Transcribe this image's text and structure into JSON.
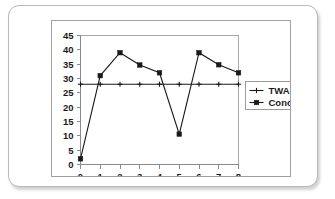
{
  "chart_data": {
    "type": "line",
    "title": "",
    "xlabel": "",
    "ylabel": "",
    "x": [
      0,
      1,
      2,
      3,
      4,
      5,
      6,
      7,
      8
    ],
    "xlim": [
      0,
      8
    ],
    "ylim": [
      0,
      45
    ],
    "x_ticks": [
      "0",
      "1",
      "2",
      "3",
      "4",
      "5",
      "6",
      "7",
      "8"
    ],
    "y_ticks": [
      "0",
      "5",
      "10",
      "15",
      "20",
      "25",
      "30",
      "35",
      "40",
      "45"
    ],
    "grid": false,
    "legend_position": "right",
    "series": [
      {
        "name": "TWA",
        "marker": "plus",
        "color": "#1a1a1a",
        "values": [
          28,
          28,
          28,
          28,
          28,
          28,
          28,
          28,
          28
        ]
      },
      {
        "name": "Concentration",
        "marker": "square",
        "color": "#1a1a1a",
        "values": [
          2,
          31,
          39,
          34.7,
          32,
          10.6,
          39,
          34.8,
          32
        ]
      }
    ]
  },
  "legend": {
    "items": [
      {
        "label": "TWA"
      },
      {
        "label": "Concentration"
      }
    ]
  },
  "colors": {
    "card_border": "#b9b9b9",
    "frame_border": "#a0a0a0",
    "axis": "#8a8a8a",
    "series": "#1a1a1a",
    "background": "#ffffff"
  }
}
